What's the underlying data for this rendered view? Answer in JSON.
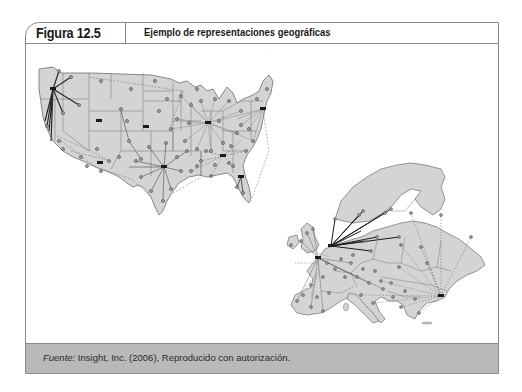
{
  "figure": {
    "number": "Figura 12.5",
    "title": "Ejemplo de representaciones geográficas"
  },
  "maps": [
    {
      "name": "united-states-map",
      "description": "Mapa de Estados Unidos con conexiones de red entre ciudades",
      "hubs": [
        "noroeste",
        "centro-norte",
        "noreste",
        "sur-centro",
        "sureste",
        "florida"
      ]
    },
    {
      "name": "europe-map",
      "description": "Mapa de Europa con conexiones de red entre ciudades",
      "hubs": [
        "europa-central",
        "sureste"
      ]
    }
  ],
  "colors": {
    "land": "#d4d4d4",
    "border": "#6e6e6e",
    "footer_bg": "#b9b9b9"
  },
  "footer": {
    "source_label": "Fuente:",
    "source_text": " Insight, Inc. (2006), Reproducido con autorización."
  }
}
